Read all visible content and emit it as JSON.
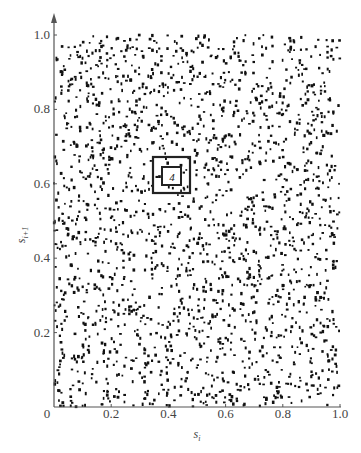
{
  "chart_data": {
    "type": "scatter",
    "title": "",
    "xlabel": "s_i",
    "ylabel": "s_{i+1}",
    "xlim": [
      0,
      1.0
    ],
    "ylim": [
      0,
      1.0
    ],
    "grid": false,
    "legend": null,
    "x_ticks": [
      "0",
      "0.2",
      "0.4",
      "0.6",
      "0.8",
      "1.0"
    ],
    "y_ticks": [
      "0.2",
      "0.4",
      "0.6",
      "0.8",
      "1.0"
    ],
    "origin_label": "0",
    "point_count_approx": 2000,
    "point_color": "#111111",
    "annotations": [
      {
        "type": "box",
        "label": "outer-box",
        "x_range": [
          0.35,
          0.48
        ],
        "y_range": [
          0.57,
          0.67
        ]
      },
      {
        "type": "box",
        "label": "inner-box",
        "x_range": [
          0.38,
          0.45
        ],
        "y_range": [
          0.59,
          0.64
        ],
        "text": "4"
      }
    ]
  },
  "labels": {
    "x_axis": "s",
    "x_axis_sub": "i",
    "y_axis": "s",
    "y_axis_sub": "i+1",
    "box_number": "4"
  }
}
